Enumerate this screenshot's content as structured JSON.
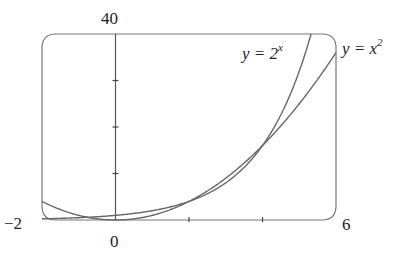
{
  "chart_data": {
    "type": "line",
    "title": "",
    "xlabel": "",
    "ylabel": "",
    "xlim": [
      -2,
      6
    ],
    "ylim": [
      0,
      40
    ],
    "grid": false,
    "x_tick_labels": {
      "left": "−2",
      "origin": "0",
      "right": "6"
    },
    "y_tick_labels": {
      "top": "40"
    },
    "x_ticks": [
      2,
      4
    ],
    "y_ticks": [
      10,
      20,
      30
    ],
    "series": [
      {
        "name": "y = 2^x",
        "label_text": "y = 2",
        "label_sup": "x",
        "function": "2^x",
        "x": [
          -2,
          -1,
          0,
          1,
          2,
          3,
          4,
          5,
          5.32
        ],
        "values": [
          0.25,
          0.5,
          1,
          2,
          4,
          8,
          16,
          32,
          40
        ]
      },
      {
        "name": "y = x^2",
        "label_text": "y = x",
        "label_sup": "2",
        "function": "x^2",
        "x": [
          -2,
          -1,
          0,
          1,
          2,
          3,
          4,
          5,
          6
        ],
        "values": [
          4,
          1,
          0,
          1,
          4,
          9,
          16,
          25,
          36
        ]
      }
    ],
    "color": "#555555"
  },
  "labels": {
    "y_top": "40",
    "x_left": "−2",
    "x_origin": "0",
    "x_right": "6",
    "curve_exp": {
      "text": "y = 2",
      "sup": "x"
    },
    "curve_sq": {
      "text": "y = x",
      "sup": "2"
    }
  }
}
